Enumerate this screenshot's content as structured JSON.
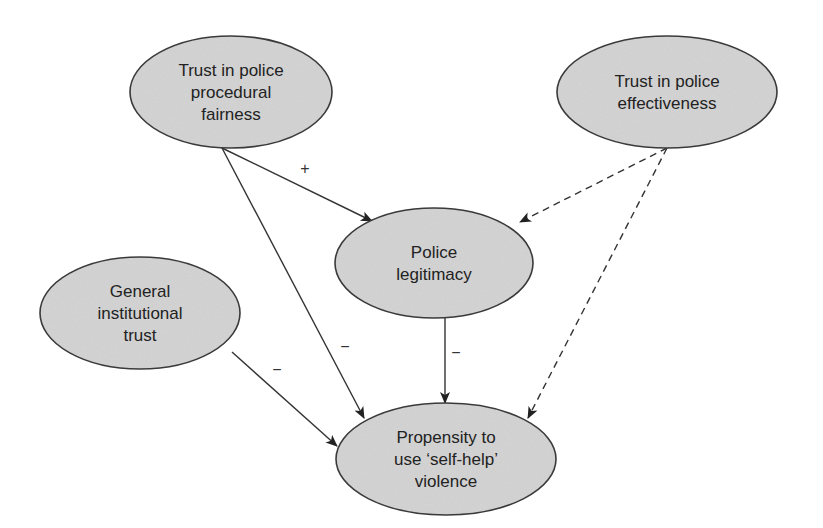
{
  "diagram": {
    "type": "path-model",
    "nodes": [
      {
        "id": "procedural",
        "lines": [
          "Trust in police",
          "procedural",
          "fairness"
        ],
        "cx": 231,
        "cy": 92,
        "rx": 101,
        "ry": 56
      },
      {
        "id": "effectiveness",
        "lines": [
          "Trust in police",
          "effectiveness"
        ],
        "cx": 667,
        "cy": 92,
        "rx": 110,
        "ry": 56
      },
      {
        "id": "legitimacy",
        "lines": [
          "Police",
          "legitimacy"
        ],
        "cx": 434,
        "cy": 263,
        "rx": 99,
        "ry": 55
      },
      {
        "id": "institutional",
        "lines": [
          "General",
          "institutional",
          "trust"
        ],
        "cx": 140,
        "cy": 313,
        "rx": 100,
        "ry": 56
      },
      {
        "id": "violence",
        "lines": [
          "Propensity to",
          "use ‘self-help’",
          "violence"
        ],
        "cx": 446,
        "cy": 459,
        "rx": 110,
        "ry": 56
      }
    ],
    "edges": [
      {
        "from": "procedural",
        "to": "legitimacy",
        "style": "solid",
        "sign": "+",
        "x1": 222,
        "y1": 148,
        "x2": 372,
        "y2": 221,
        "lx": 305,
        "ly": 174
      },
      {
        "from": "procedural",
        "to": "violence",
        "style": "solid",
        "sign": "−",
        "x1": 222,
        "y1": 148,
        "x2": 364,
        "y2": 418,
        "lx": 345,
        "ly": 352
      },
      {
        "from": "effectiveness",
        "to": "legitimacy",
        "style": "dashed",
        "sign": "",
        "x1": 667,
        "y1": 148,
        "x2": 520,
        "y2": 222,
        "lx": 0,
        "ly": 0
      },
      {
        "from": "effectiveness",
        "to": "violence",
        "style": "dashed",
        "sign": "",
        "x1": 667,
        "y1": 148,
        "x2": 528,
        "y2": 418,
        "lx": 0,
        "ly": 0
      },
      {
        "from": "legitimacy",
        "to": "violence",
        "style": "solid",
        "sign": "−",
        "x1": 445,
        "y1": 318,
        "x2": 445,
        "y2": 403,
        "lx": 456,
        "ly": 358
      },
      {
        "from": "institutional",
        "to": "violence",
        "style": "solid",
        "sign": "−",
        "x1": 232,
        "y1": 352,
        "x2": 337,
        "y2": 446,
        "lx": 277,
        "ly": 375
      }
    ],
    "colors": {
      "node_fill": "#d6d6d6",
      "stroke": "#333333",
      "background": "#ffffff"
    }
  }
}
